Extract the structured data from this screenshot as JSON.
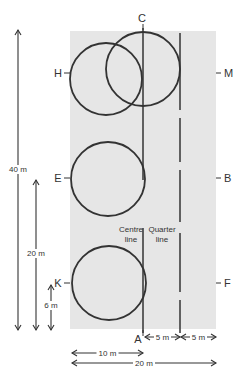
{
  "diagram": {
    "colors": {
      "arena_fill": "#e6e6e6",
      "stroke": "#333333",
      "text": "#333333",
      "background": "#ffffff"
    },
    "arena": {
      "x": 70,
      "y": 31,
      "width": 146,
      "height": 298
    },
    "markers": {
      "C": {
        "label": "C",
        "x": 142,
        "y": 22
      },
      "A": {
        "label": "A",
        "x": 138,
        "y": 343
      },
      "H": {
        "label": "H",
        "x": 58,
        "y": 77
      },
      "E": {
        "label": "E",
        "x": 58,
        "y": 182
      },
      "K": {
        "label": "K",
        "x": 58,
        "y": 287
      },
      "M": {
        "label": "M",
        "x": 224,
        "y": 77
      },
      "B": {
        "label": "B",
        "x": 224,
        "y": 182
      },
      "F": {
        "label": "F",
        "x": 224,
        "y": 287
      }
    },
    "circles": [
      {
        "name": "circle-at-H",
        "cx": 106,
        "cy": 79,
        "r": 36
      },
      {
        "name": "circle-at-C",
        "cx": 143,
        "cy": 69,
        "r": 37
      },
      {
        "name": "circle-at-E",
        "cx": 108,
        "cy": 179,
        "r": 37
      },
      {
        "name": "circle-at-K",
        "cx": 109,
        "cy": 283,
        "r": 37
      }
    ],
    "lines": {
      "centre_line": {
        "label_line1": "Centre",
        "label_line2": "line",
        "x": 143,
        "segments": [
          [
            28,
            180
          ],
          [
            228,
            333
          ]
        ]
      },
      "quarter_line": {
        "label_line1": "Quarter",
        "label_line2": "line",
        "x": 180,
        "segments": [
          [
            33,
            110
          ],
          [
            118,
            162
          ],
          [
            170,
            222
          ],
          [
            233,
            292
          ],
          [
            300,
            333
          ]
        ]
      }
    },
    "dimensions": {
      "length_40": {
        "label": "40 m",
        "x": 18,
        "y1": 30,
        "y2": 330,
        "label_y": 172
      },
      "length_20": {
        "label": "20 m",
        "x": 36,
        "y1": 180,
        "y2": 330,
        "label_y": 256
      },
      "length_6": {
        "label": "6 m",
        "x": 51,
        "y1": 285,
        "y2": 330,
        "label_y": 308
      },
      "width_5_a": {
        "label": "5 m",
        "x1": 145,
        "x2": 180,
        "y": 337
      },
      "width_5_b": {
        "label": "5 m",
        "x1": 181,
        "x2": 216,
        "y": 337
      },
      "width_10": {
        "label": "10 m",
        "x1": 72,
        "x2": 143,
        "y": 353
      },
      "width_20": {
        "label": "20 m",
        "x1": 72,
        "x2": 216,
        "y": 363
      }
    }
  }
}
